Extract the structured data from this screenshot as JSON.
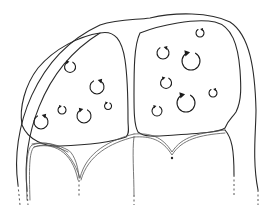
{
  "diagram": {
    "title": "",
    "colors": {
      "line": "#2a2a2a",
      "background": "#ffffff"
    },
    "cells": [
      {
        "id": "left-cell",
        "organelles": [
          {
            "cx": 70,
            "cy": 67,
            "r": 5.5,
            "dir": "ccw"
          },
          {
            "cx": 97,
            "cy": 87,
            "r": 7,
            "dir": "cw"
          },
          {
            "cx": 41,
            "cy": 122,
            "r": 7,
            "dir": "cw"
          },
          {
            "cx": 62,
            "cy": 110,
            "r": 4,
            "dir": "ccw"
          },
          {
            "cx": 84,
            "cy": 116,
            "r": 7,
            "dir": "ccw"
          },
          {
            "cx": 108,
            "cy": 106,
            "r": 3.5,
            "dir": "ccw"
          }
        ]
      },
      {
        "id": "right-cell",
        "organelles": [
          {
            "cx": 200,
            "cy": 33,
            "r": 4,
            "dir": "cw"
          },
          {
            "cx": 163,
            "cy": 53,
            "r": 6,
            "dir": "cw"
          },
          {
            "cx": 191,
            "cy": 61,
            "r": 9,
            "dir": "ccw"
          },
          {
            "cx": 166,
            "cy": 83,
            "r": 5.5,
            "dir": "ccw"
          },
          {
            "cx": 213,
            "cy": 93,
            "r": 4,
            "dir": "cw"
          },
          {
            "cx": 186,
            "cy": 103,
            "r": 9,
            "dir": "ccw"
          },
          {
            "cx": 157,
            "cy": 111,
            "r": 5,
            "dir": "ccw"
          }
        ]
      }
    ],
    "labels": []
  }
}
